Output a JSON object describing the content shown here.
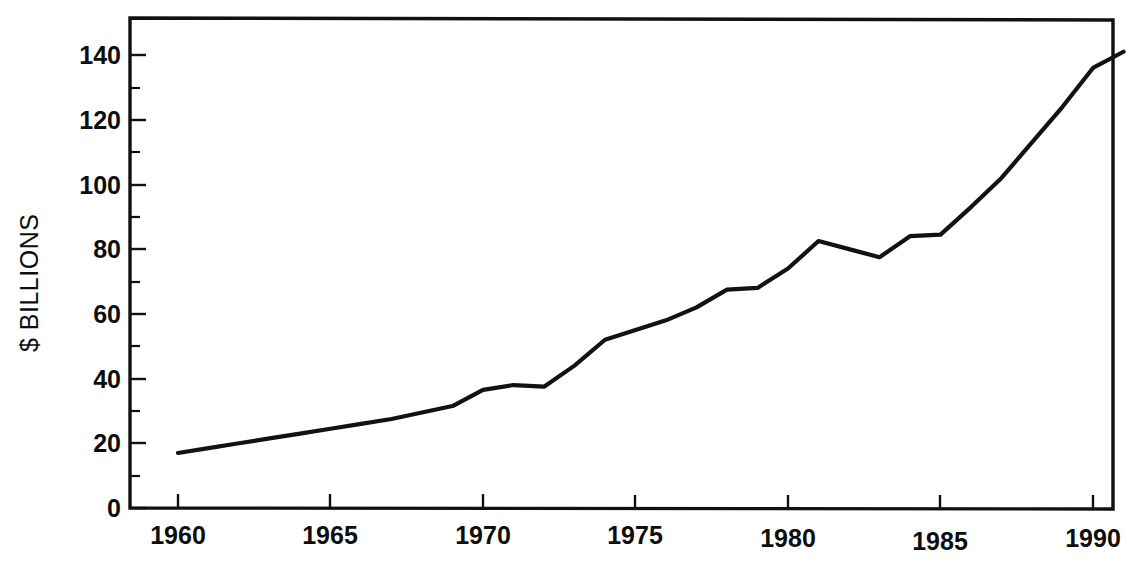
{
  "chart_data": {
    "type": "line",
    "title": "",
    "subtitle": "",
    "xlabel": "",
    "ylabel": "$ BILLIONS",
    "xlim": [
      1959.4,
      1991.9
    ],
    "ylim": [
      0,
      150
    ],
    "grid": false,
    "legend": null,
    "legend_position": "none",
    "x_major_ticks": [
      1960,
      1965,
      1970,
      1975,
      1980,
      1985,
      1990
    ],
    "x_tick_labels": [
      "1960",
      "1965",
      "1970",
      "1975",
      "1980",
      "1985",
      "1990"
    ],
    "x_minor_tick_interval": 1,
    "y_major_ticks": [
      0,
      20,
      40,
      60,
      80,
      100,
      120,
      140
    ],
    "y_tick_labels": [
      "0",
      "20",
      "40",
      "60",
      "80",
      "100",
      "120",
      "140"
    ],
    "y_minor_ticks": [
      10,
      30,
      50,
      70,
      90,
      110,
      130
    ],
    "line_color": "#121212",
    "series": [
      {
        "name": "value",
        "x": [
          1960,
          1961,
          1962,
          1963,
          1964,
          1965,
          1966,
          1967,
          1968,
          1969,
          1970,
          1971,
          1972,
          1973,
          1974,
          1975,
          1976,
          1977,
          1978,
          1979,
          1980,
          1981,
          1982,
          1983,
          1984,
          1985,
          1986,
          1987,
          1988,
          1989,
          1990,
          1991
        ],
        "values": [
          17,
          18.5,
          20,
          21.5,
          23,
          24.5,
          26,
          27.5,
          29.5,
          31.5,
          36.5,
          38,
          37.5,
          44,
          52,
          55,
          58,
          62,
          67.5,
          68,
          74,
          82.5,
          80,
          77.5,
          84,
          84.5,
          93,
          102,
          113,
          124,
          136,
          141
        ]
      }
    ]
  },
  "axis": {
    "y_title": "$ BILLIONS",
    "x_labels": [
      "1960",
      "1965",
      "1970",
      "1975",
      "1980",
      "1985",
      "1990"
    ],
    "y_labels": [
      "140",
      "120",
      "100",
      "80",
      "60",
      "40",
      "20",
      "0"
    ]
  },
  "caption": {
    "partial_text": ""
  }
}
